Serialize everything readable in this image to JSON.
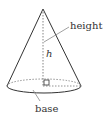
{
  "diagram": {
    "labels": {
      "height": "height",
      "h": "h",
      "base": "base"
    },
    "colors": {
      "stroke": "#333333",
      "dashed": "#666666",
      "background": "#ffffff"
    }
  }
}
